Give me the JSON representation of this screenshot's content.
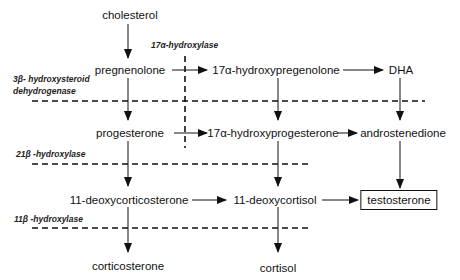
{
  "nodes": {
    "cholesterol": "cholesterol",
    "pregnenolone": "pregnenolone",
    "hydroxypregnenolone": "17α-hydroxypregenolone",
    "dha": "DHA",
    "progesterone": "progesterone",
    "hydroxyprogesterone": "17α-hydroxyprogesterone",
    "androstenedione": "androstenedione",
    "deoxycorticosterone": "11-deoxycorticosterone",
    "deoxycortisol": "11-deoxycortisol",
    "testosterone": "testosterone",
    "corticosterone": "corticosterone",
    "cortisol": "cortisol"
  },
  "enzymes": {
    "hydroxylase17a": "17α-hydroxylase",
    "hsd3b_line1": "3β- hydroxysteroid",
    "hsd3b_line2": "dehydrogenase",
    "hydroxylase21b": "21β -hydroxylase",
    "hydroxylase11b": "11β -hydroxylase"
  },
  "edges": [
    [
      "cholesterol",
      "pregnenolone"
    ],
    [
      "pregnenolone",
      "progesterone"
    ],
    [
      "pregnenolone",
      "17α-hydroxypregenolone"
    ],
    [
      "17α-hydroxypregenolone",
      "DHA"
    ],
    [
      "17α-hydroxypregenolone",
      "17α-hydroxyprogesterone"
    ],
    [
      "DHA",
      "androstenedione"
    ],
    [
      "progesterone",
      "17α-hydroxyprogesterone"
    ],
    [
      "17α-hydroxyprogesterone",
      "androstenedione"
    ],
    [
      "progesterone",
      "11-deoxycorticosterone"
    ],
    [
      "17α-hydroxyprogesterone",
      "11-deoxycortisol"
    ],
    [
      "androstenedione",
      "testosterone"
    ],
    [
      "11-deoxycorticosterone",
      "11-deoxycortisol"
    ],
    [
      "11-deoxycortisol",
      "testosterone"
    ],
    [
      "11-deoxycorticosterone",
      "corticosterone"
    ],
    [
      "11-deoxycortisol",
      "cortisol"
    ]
  ],
  "colors": {
    "ink": "#111111",
    "background": "#ffffff"
  }
}
